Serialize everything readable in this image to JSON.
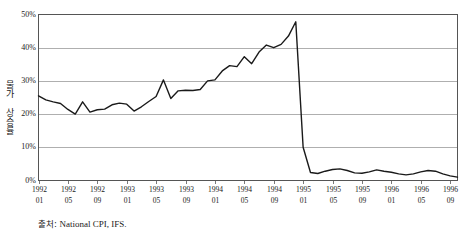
{
  "chart_data": {
    "type": "line",
    "title": "",
    "subtitle": "",
    "xlabel": "",
    "ylabel": "물가 상승률",
    "ylim": [
      0,
      50
    ],
    "ytick_labels": [
      "0%",
      "10%",
      "20%",
      "30%",
      "40%",
      "50%"
    ],
    "ytick_values": [
      0,
      10,
      20,
      30,
      40,
      50
    ],
    "grid": true,
    "legend": "none",
    "xtick_labels": [
      {
        "year": "1992",
        "month": "01"
      },
      {
        "year": "1992",
        "month": "05"
      },
      {
        "year": "1992",
        "month": "09"
      },
      {
        "year": "1993",
        "month": "01"
      },
      {
        "year": "1993",
        "month": "05"
      },
      {
        "year": "1993",
        "month": "09"
      },
      {
        "year": "1994",
        "month": "01"
      },
      {
        "year": "1994",
        "month": "05"
      },
      {
        "year": "1994",
        "month": "09"
      },
      {
        "year": "1995",
        "month": "01"
      },
      {
        "year": "1995",
        "month": "05"
      },
      {
        "year": "1995",
        "month": "09"
      },
      {
        "year": "1996",
        "month": "01"
      },
      {
        "year": "1996",
        "month": "05"
      },
      {
        "year": "1996",
        "month": "09"
      }
    ],
    "x": [
      "1992-01",
      "1992-02",
      "1992-03",
      "1992-04",
      "1992-05",
      "1992-06",
      "1992-07",
      "1992-08",
      "1992-09",
      "1992-10",
      "1992-11",
      "1992-12",
      "1993-01",
      "1993-02",
      "1993-03",
      "1993-04",
      "1993-05",
      "1993-06",
      "1993-07",
      "1993-08",
      "1993-09",
      "1993-10",
      "1993-11",
      "1993-12",
      "1994-01",
      "1994-02",
      "1994-03",
      "1994-04",
      "1994-05",
      "1994-06",
      "1994-07",
      "1994-08",
      "1994-09",
      "1994-10",
      "1994-11",
      "1994-12",
      "1995-01",
      "1995-02",
      "1995-03",
      "1995-04",
      "1995-05",
      "1995-06",
      "1995-07",
      "1995-08",
      "1995-09",
      "1995-10",
      "1995-11",
      "1995-12",
      "1996-01",
      "1996-02",
      "1996-03",
      "1996-04",
      "1996-05",
      "1996-06",
      "1996-07",
      "1996-08",
      "1996-09",
      "1996-10"
    ],
    "series": [
      {
        "name": "물가 상승률",
        "color": "#1a1a1a",
        "values": [
          25.5,
          24.3,
          23.7,
          23.2,
          21.4,
          20.0,
          23.7,
          20.6,
          21.3,
          21.5,
          22.8,
          23.3,
          23.0,
          20.9,
          22.2,
          23.8,
          25.3,
          30.3,
          24.7,
          27.0,
          27.2,
          27.1,
          27.4,
          30.0,
          30.3,
          33.0,
          34.6,
          34.3,
          37.3,
          35.2,
          38.7,
          40.8,
          40.0,
          41.0,
          43.5,
          47.8,
          10.0,
          2.4,
          2.1,
          2.8,
          3.3,
          3.5,
          3.0,
          2.3,
          2.2,
          2.6,
          3.2,
          2.8,
          2.5,
          2.0,
          1.7,
          2.0,
          2.6,
          3.0,
          2.8,
          2.0,
          1.4,
          1.0
        ]
      }
    ],
    "annotations": [
      {
        "text": "peak",
        "value": 47.8,
        "x": "1994-12"
      },
      {
        "text": "crash",
        "value": 2.4,
        "x": "1995-02"
      }
    ]
  },
  "source": {
    "label": "출처",
    "separator": ": ",
    "value": "National CPI, IFS."
  }
}
